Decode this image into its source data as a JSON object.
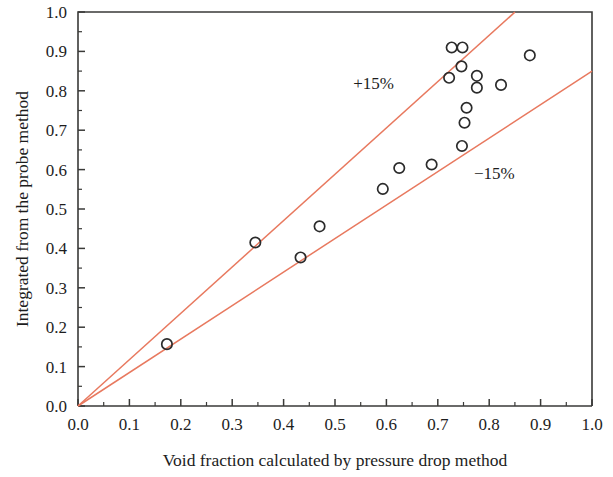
{
  "chart_data": {
    "type": "scatter",
    "title": "",
    "xlabel": "Void fraction calculated by pressure drop method",
    "ylabel": "Integrated from the probe method",
    "xlim": [
      0.0,
      1.0
    ],
    "ylim": [
      0.0,
      1.0
    ],
    "grid": false,
    "legend_position": "none",
    "xticks": [
      "0.0",
      "0.1",
      "0.2",
      "0.3",
      "0.4",
      "0.5",
      "0.6",
      "0.7",
      "0.8",
      "0.9",
      "1.0"
    ],
    "yticks": [
      "0.0",
      "0.1",
      "0.2",
      "0.3",
      "0.4",
      "0.5",
      "0.6",
      "0.7",
      "0.8",
      "0.9",
      "1.0"
    ],
    "xtick_values": [
      0.0,
      0.1,
      0.2,
      0.3,
      0.4,
      0.5,
      0.6,
      0.7,
      0.8,
      0.9,
      1.0
    ],
    "ytick_values": [
      0.0,
      0.1,
      0.2,
      0.3,
      0.4,
      0.5,
      0.6,
      0.7,
      0.8,
      0.9,
      1.0
    ],
    "minor_ticks_per_interval": 1,
    "marker": "open-circle",
    "marker_color": "#2b2b2b",
    "series": [
      {
        "name": "measurements",
        "points": [
          [
            0.173,
            0.157
          ],
          [
            0.345,
            0.415
          ],
          [
            0.433,
            0.377
          ],
          [
            0.47,
            0.456
          ],
          [
            0.593,
            0.551
          ],
          [
            0.625,
            0.604
          ],
          [
            0.688,
            0.613
          ],
          [
            0.727,
            0.91
          ],
          [
            0.748,
            0.91
          ],
          [
            0.722,
            0.833
          ],
          [
            0.746,
            0.862
          ],
          [
            0.776,
            0.838
          ],
          [
            0.776,
            0.808
          ],
          [
            0.756,
            0.757
          ],
          [
            0.752,
            0.719
          ],
          [
            0.747,
            0.66
          ],
          [
            0.823,
            0.815
          ],
          [
            0.879,
            0.89
          ]
        ]
      }
    ],
    "reference_lines": [
      {
        "name": "plus-15-percent",
        "label": "+15%",
        "color": "#e8795f",
        "slope": 1.176,
        "intercept": 0.0,
        "x_range": [
          0.0,
          0.85
        ],
        "label_position": [
          0.575,
          0.805
        ]
      },
      {
        "name": "minus-15-percent",
        "label": "−15%",
        "color": "#e8795f",
        "slope": 0.85,
        "intercept": 0.0,
        "x_range": [
          0.0,
          1.0
        ],
        "label_position": [
          0.81,
          0.575
        ]
      }
    ]
  }
}
